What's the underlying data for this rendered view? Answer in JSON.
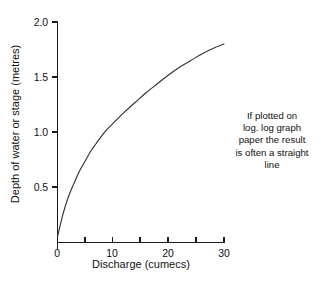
{
  "chart_data": {
    "type": "line",
    "title": "",
    "xlabel": "Discharge (cumecs)",
    "ylabel": "Depth of water or stage (metres)",
    "xlim": [
      0,
      30
    ],
    "ylim": [
      0,
      2.0
    ],
    "grid": false,
    "legend": false,
    "line_color": "#333333",
    "axis_color": "#1a1a1a",
    "xticks": [
      0,
      5,
      10,
      15,
      20,
      25,
      30
    ],
    "xtick_labels": [
      "0",
      "",
      "10",
      "",
      "20",
      "",
      "30"
    ],
    "yticks": [
      0.5,
      1.0,
      1.5,
      2.0
    ],
    "ytick_labels": [
      "0.5",
      "1.0",
      "1.5",
      "2.0"
    ],
    "series": [
      {
        "name": "Rating curve",
        "x": [
          0,
          1,
          2,
          3,
          4,
          5,
          6,
          7,
          8,
          9,
          10,
          12,
          14,
          16,
          18,
          20,
          22,
          24,
          26,
          28,
          30
        ],
        "y": [
          0.05,
          0.26,
          0.42,
          0.54,
          0.65,
          0.74,
          0.83,
          0.9,
          0.97,
          1.03,
          1.08,
          1.18,
          1.27,
          1.36,
          1.44,
          1.52,
          1.59,
          1.65,
          1.71,
          1.76,
          1.8
        ]
      }
    ],
    "annotations": [
      {
        "name": "loglog-note",
        "lines": [
          "If plotted on",
          "log. log graph",
          "paper the result",
          "is often a straight",
          "line"
        ]
      }
    ]
  },
  "axes": {
    "x_title": "Discharge (cumecs)",
    "y_title": "Depth of water or stage (metres)",
    "x_labels": {
      "t0": "0",
      "t10": "10",
      "t20": "20",
      "t30": "30"
    },
    "y_labels": {
      "t05": "0.5",
      "t10": "1.0",
      "t15": "1.5",
      "t20": "2.0"
    }
  },
  "note": {
    "line1": "If plotted on",
    "line2": "log. log graph",
    "line3": "paper the result",
    "line4": "is often a straight",
    "line5": "line"
  }
}
